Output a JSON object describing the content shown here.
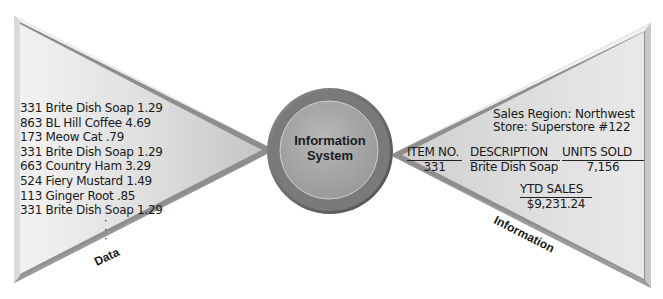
{
  "diagram": {
    "type": "input-process-output",
    "input": {
      "label": "Data",
      "records": [
        "331 Brite Dish Soap  1.29",
        "863 BL Hill Coffee  4.69",
        "173 Meow Cat  .79",
        "331 Brite Dish Soap  1.29",
        "663 Country Ham 3.29",
        "524 Fiery Mustard  1.49",
        "113 Ginger Root  .85",
        "331 Brite Dish Soap  1.29"
      ],
      "continuation": "⋮"
    },
    "process": {
      "line1": "Information",
      "line2": "System"
    },
    "output": {
      "label": "Information",
      "region": "Sales Region: Northwest",
      "store": "Store: Superstore #122",
      "columns": [
        {
          "header": "ITEM NO.",
          "value": "331"
        },
        {
          "header": "DESCRIPTION",
          "value": "Brite Dish Soap"
        },
        {
          "header": "UNITS SOLD",
          "value": "7,156"
        }
      ],
      "ytd": {
        "header": "YTD SALES",
        "value": "$9,231.24"
      }
    },
    "colors": {
      "triangle_light": "#eeeeee",
      "triangle_mid": "#c8c8c8",
      "bevel_dark": "#9a9a9a",
      "circle_outer": "#6e6e6e",
      "circle_inner": "#a9a9a9",
      "text": "#1a1a1a"
    }
  }
}
